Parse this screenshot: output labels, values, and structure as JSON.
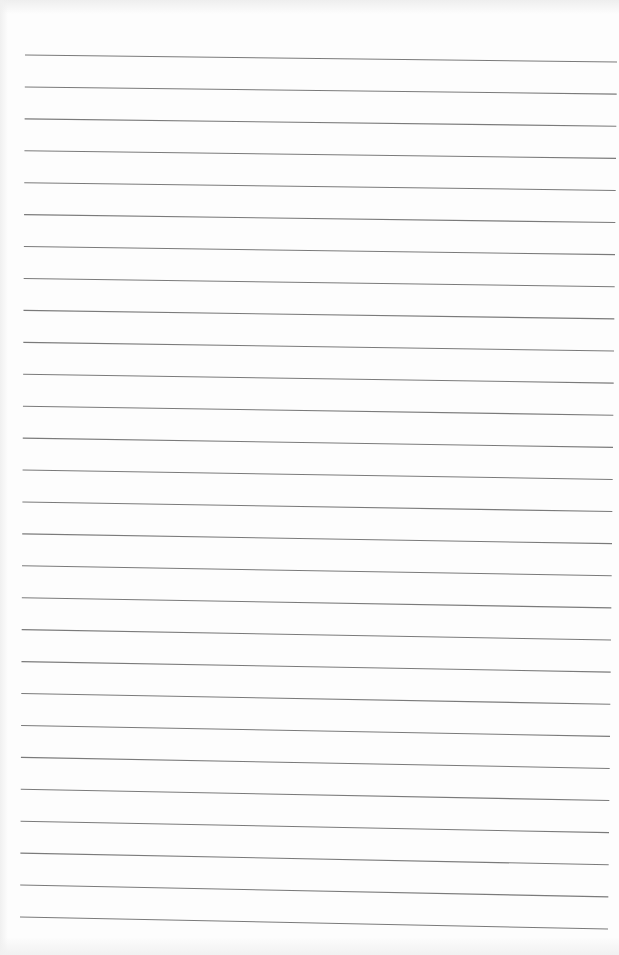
{
  "page": {
    "type": "lined-paper",
    "background": "#fdfdfd",
    "line_color": "#7a7a7a",
    "line_width": 1.1,
    "line_count": 28,
    "line_spacing_px": 32,
    "first_line": {
      "x1": 25,
      "y1": 55,
      "x2": 617,
      "y2": 62
    },
    "last_line": {
      "x1": 20,
      "y1": 917,
      "x2": 608,
      "y2": 929
    }
  }
}
